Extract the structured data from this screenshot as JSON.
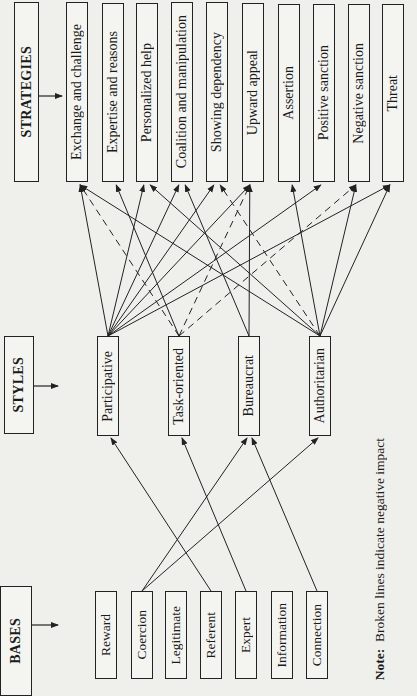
{
  "heads": {
    "strategies": "STRATEGIES",
    "styles": "STYLES",
    "bases": "BASES"
  },
  "strategies": [
    {
      "label": "Exchange and challenge",
      "x": 66,
      "y": 2
    },
    {
      "label": "Expertise and reasons",
      "x": 102,
      "y": 3
    },
    {
      "label": "Personalized help",
      "x": 136,
      "y": 3
    },
    {
      "label": "Coalition and manipulation",
      "x": 171,
      "y": 2
    },
    {
      "label": "Showing dependency",
      "x": 206,
      "y": 2
    },
    {
      "label": "Upward appeal",
      "x": 242,
      "y": 3
    },
    {
      "label": "Assertion",
      "x": 278,
      "y": 4
    },
    {
      "label": "Positive sanction",
      "x": 313,
      "y": 4
    },
    {
      "label": "Negative sanction",
      "x": 348,
      "y": 4
    },
    {
      "label": "Threat",
      "x": 382,
      "y": 4
    }
  ],
  "styles": [
    {
      "label": "Participative",
      "x": 97
    },
    {
      "label": "Task-oriented",
      "x": 168
    },
    {
      "label": "Bureaucrat",
      "x": 238
    },
    {
      "label": "Authoritarian",
      "x": 309
    }
  ],
  "bases": [
    {
      "label": "Reward",
      "x": 95
    },
    {
      "label": "Coercion",
      "x": 131
    },
    {
      "label": "Legitimate",
      "x": 165
    },
    {
      "label": "Referent",
      "x": 200
    },
    {
      "label": "Expert",
      "x": 235
    },
    {
      "label": "Information",
      "x": 271
    },
    {
      "label": "Connection",
      "x": 306
    }
  ],
  "edges_style_to_strategy": [
    {
      "from": "Participative",
      "to": "Exchange and challenge",
      "type": "solid"
    },
    {
      "from": "Participative",
      "to": "Personalized help",
      "type": "solid"
    },
    {
      "from": "Participative",
      "to": "Coalition and manipulation",
      "type": "solid"
    },
    {
      "from": "Participative",
      "to": "Showing dependency",
      "type": "solid"
    },
    {
      "from": "Participative",
      "to": "Upward appeal",
      "type": "solid"
    },
    {
      "from": "Participative",
      "to": "Positive sanction",
      "type": "solid"
    },
    {
      "from": "Participative",
      "to": "Threat",
      "type": "solid"
    },
    {
      "from": "Task-oriented",
      "to": "Exchange and challenge",
      "type": "dashed"
    },
    {
      "from": "Task-oriented",
      "to": "Expertise and reasons",
      "type": "solid"
    },
    {
      "from": "Task-oriented",
      "to": "Upward appeal",
      "type": "dashed"
    },
    {
      "from": "Task-oriented",
      "to": "Negative sanction",
      "type": "dashed"
    },
    {
      "from": "Bureaucrat",
      "to": "Coalition and manipulation",
      "type": "solid"
    },
    {
      "from": "Bureaucrat",
      "to": "Upward appeal",
      "type": "solid"
    },
    {
      "from": "Authoritarian",
      "to": "Exchange and challenge",
      "type": "solid"
    },
    {
      "from": "Authoritarian",
      "to": "Personalized help",
      "type": "solid"
    },
    {
      "from": "Authoritarian",
      "to": "Showing dependency",
      "type": "dashed"
    },
    {
      "from": "Authoritarian",
      "to": "Assertion",
      "type": "solid"
    },
    {
      "from": "Authoritarian",
      "to": "Negative sanction",
      "type": "solid"
    },
    {
      "from": "Authoritarian",
      "to": "Threat",
      "type": "solid"
    }
  ],
  "edges_base_to_style": [
    {
      "from": "Coercion",
      "to": "Bureaucrat",
      "type": "solid"
    },
    {
      "from": "Coercion",
      "to": "Authoritarian",
      "type": "solid"
    },
    {
      "from": "Referent",
      "to": "Participative",
      "type": "solid"
    },
    {
      "from": "Expert",
      "to": "Task-oriented",
      "type": "solid"
    },
    {
      "from": "Connection",
      "to": "Bureaucrat",
      "type": "solid"
    }
  ],
  "note": {
    "prefix": "Note:",
    "text": "Broken lines indicate negative impact"
  },
  "colors": {
    "line": "#222222",
    "paper": "#efefec"
  }
}
